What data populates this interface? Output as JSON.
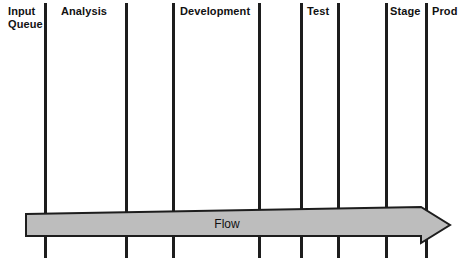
{
  "diagram": {
    "background_color": "#ffffff",
    "line_color": "#1d1d1d",
    "arrow_fill": "#bdbdbd",
    "arrow_stroke": "#1d1d1d",
    "columns": [
      {
        "label": "Input\nQueue",
        "label_x": 8,
        "label_y": 5,
        "divider_x": 44,
        "divider_top": 3,
        "divider_bottom": 258
      },
      {
        "label": "Analysis",
        "label_x": 61,
        "label_y": 5,
        "divider_x": 125,
        "divider_top": 3,
        "divider_bottom": 258
      },
      {
        "label": "",
        "label_x": 0,
        "label_y": 0,
        "divider_x": 172,
        "divider_top": 3,
        "divider_bottom": 258
      },
      {
        "label": "Development",
        "label_x": 180,
        "label_y": 5,
        "divider_x": 258,
        "divider_top": 3,
        "divider_bottom": 258
      },
      {
        "label": "",
        "label_x": 0,
        "label_y": 0,
        "divider_x": 300,
        "divider_top": 3,
        "divider_bottom": 258
      },
      {
        "label": "Test",
        "label_x": 307,
        "label_y": 5,
        "divider_x": 337,
        "divider_top": 3,
        "divider_bottom": 258
      },
      {
        "label": "",
        "label_x": 0,
        "label_y": 0,
        "divider_x": 385,
        "divider_top": 3,
        "divider_bottom": 258
      },
      {
        "label": "Stage",
        "label_x": 390,
        "label_y": 5,
        "divider_x": 425,
        "divider_top": 3,
        "divider_bottom": 258
      },
      {
        "label": "Prod",
        "label_x": 432,
        "label_y": 5,
        "divider_x": null,
        "divider_top": 0,
        "divider_bottom": 0
      }
    ],
    "flow": {
      "label": "Flow",
      "label_x": 205,
      "label_y": 217,
      "body_left": 26,
      "body_top": 214,
      "body_bottom": 236,
      "head_base_x": 421,
      "head_tip_x": 450,
      "head_top": 207,
      "head_bottom": 243
    }
  }
}
